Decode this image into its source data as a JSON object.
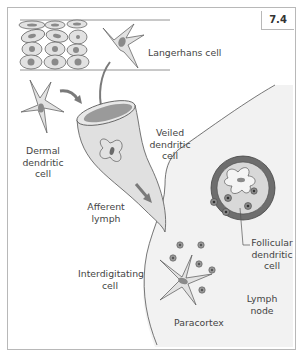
{
  "figure": {
    "number": "7.4"
  },
  "labels": {
    "langerhans": "Langerhans cell",
    "dermal_l1": "Dermal",
    "dermal_l2": "dendritic",
    "dermal_l3": "cell",
    "veiled_l1": "Veiled",
    "veiled_l2": "dendritic",
    "veiled_l3": "cell",
    "afferent_l1": "Afferent",
    "afferent_l2": "lymph",
    "follicular_l1": "Follicular",
    "follicular_l2": "dendritic",
    "follicular_l3": "cell",
    "interdigitating_l1": "Interdigitating",
    "interdigitating_l2": "cell",
    "lymph_l1": "Lymph",
    "lymph_l2": "node",
    "paracortex": "Paracortex"
  },
  "colors": {
    "cell_fill": "#e2e2e2",
    "nucleus": "#8a8a8a",
    "vessel_fill": "#e0e0e0",
    "vessel_inner": "#9a9a9a",
    "node_fill": "#f2f2f2",
    "follicle_ring": "#6e6e6e",
    "arrow": "#7a7a7a",
    "outline": "#555555"
  }
}
